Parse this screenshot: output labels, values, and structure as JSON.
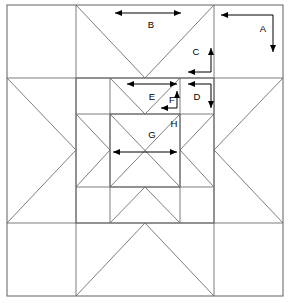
{
  "diagram": {
    "type": "nested-star-quilt-block",
    "background_color": "#ffffff",
    "line_color": "#6e6e6e",
    "dimension_color": "#000000",
    "canvas": {
      "width": 289,
      "height": 303
    },
    "outer_block": {
      "name": "outer-block-square",
      "x1": 7,
      "y1": 5,
      "x2": 283,
      "y2": 296,
      "grid_x": [
        7,
        76,
        145,
        214,
        283
      ],
      "grid_y": [
        5,
        78,
        150,
        223,
        296
      ]
    },
    "middle_block": {
      "name": "middle-block-square",
      "x1": 76,
      "y1": 78,
      "x2": 214,
      "y2": 223,
      "grid_x": [
        76,
        110,
        145,
        180,
        214
      ],
      "grid_y": [
        78,
        114,
        150,
        187,
        223
      ]
    },
    "inner_block": {
      "name": "inner-block-square",
      "x1": 110,
      "y1": 114,
      "x2": 180,
      "y2": 187,
      "grid_x": [
        110,
        145,
        180
      ],
      "grid_y": [
        114,
        150,
        187
      ]
    }
  },
  "dimensions": [
    {
      "id": "A",
      "label": "A",
      "name": "dimension-marker-a",
      "kind": "corner-bracket",
      "description": "outer corner unit width and height",
      "label_x": 263,
      "label_y": 29,
      "corner_x": 273,
      "corner_y": 15,
      "h_end_x": 221,
      "h_end_y": 15,
      "v_end_x": 273,
      "v_end_y": 52,
      "h_arrow": "left",
      "v_arrow": "down"
    },
    {
      "id": "B",
      "label": "B",
      "name": "dimension-marker-b",
      "kind": "double-arrow-horizontal",
      "description": "width of outer star point unit",
      "label_x": 151,
      "label_y": 25,
      "x1": 115,
      "x2": 181,
      "y": 13
    },
    {
      "id": "C",
      "label": "C",
      "name": "dimension-marker-c",
      "kind": "corner-bracket",
      "description": "outer star point half-height",
      "label_x": 196,
      "label_y": 52,
      "corner_x": 211,
      "corner_y": 72,
      "h_end_x": 188,
      "h_end_y": 72,
      "v_end_x": 211,
      "v_end_y": 48,
      "h_arrow": "left",
      "v_arrow": "up"
    },
    {
      "id": "D",
      "label": "D",
      "name": "dimension-marker-d",
      "kind": "corner-bracket",
      "description": "middle corner unit size",
      "label_x": 197,
      "label_y": 97,
      "corner_x": 211,
      "corner_y": 84,
      "h_end_x": 188,
      "h_end_y": 84,
      "v_end_x": 211,
      "v_end_y": 108,
      "h_arrow": "left",
      "v_arrow": "down"
    },
    {
      "id": "E",
      "label": "E",
      "name": "dimension-marker-e",
      "kind": "double-arrow-horizontal",
      "description": "width of middle star point unit",
      "label_x": 152,
      "label_y": 97,
      "x1": 127,
      "x2": 177,
      "y": 84
    },
    {
      "id": "F",
      "label": "F",
      "name": "dimension-marker-f",
      "kind": "corner-bracket",
      "description": "middle star point half-height",
      "label_x": 172,
      "label_y": 100,
      "corner_x": 177,
      "corner_y": 108,
      "h_end_x": 161,
      "h_end_y": 108,
      "v_end_x": 177,
      "v_end_y": 91,
      "h_arrow": "left",
      "v_arrow": "up"
    },
    {
      "id": "G",
      "label": "G",
      "name": "dimension-marker-g",
      "kind": "double-arrow-horizontal",
      "description": "width of inner star center",
      "label_x": 152,
      "label_y": 135,
      "x1": 113,
      "x2": 177,
      "y": 152
    },
    {
      "id": "H",
      "label": "H",
      "name": "dimension-marker-h",
      "kind": "label-only",
      "description": "inner block corner unit callout",
      "label_x": 174,
      "label_y": 124
    }
  ]
}
